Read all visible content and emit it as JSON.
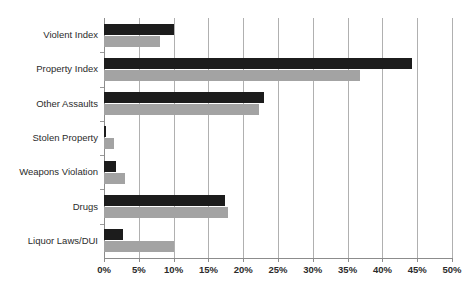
{
  "chart_data": {
    "type": "bar",
    "orientation": "horizontal",
    "title": "",
    "xlabel": "",
    "ylabel": "",
    "xlim": [
      0,
      50
    ],
    "xtick_values": [
      0,
      5,
      10,
      15,
      20,
      25,
      30,
      35,
      40,
      45,
      50
    ],
    "xtick_labels": [
      "0%",
      "5%",
      "10%",
      "15%",
      "20%",
      "25%",
      "30%",
      "35%",
      "40%",
      "45%",
      "50%"
    ],
    "grid": true,
    "grid_axis": "x",
    "legend": null,
    "legend_position": "none",
    "categories": [
      "Violent Index",
      "Property Index",
      "Other Assaults",
      "Stolen Property",
      "Weapons Violation",
      "Drugs",
      "Liquor Laws/DUI"
    ],
    "series": [
      {
        "name": "series-1",
        "color": "#1c1c1c",
        "values": [
          10.0,
          44.2,
          23.0,
          0.3,
          1.7,
          17.4,
          2.7
        ]
      },
      {
        "name": "series-2",
        "color": "#a3a3a3",
        "values": [
          8.0,
          36.8,
          22.3,
          1.4,
          3.0,
          17.8,
          10.0
        ]
      }
    ]
  },
  "axis": {
    "value_suffix": "%"
  }
}
